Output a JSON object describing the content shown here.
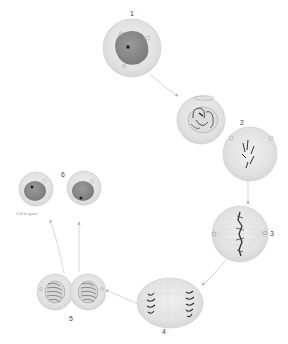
{
  "diagram": {
    "colors": {
      "cell_fill": "#e4e4e4",
      "cell_edge": "#cfcfcf",
      "inner_fill": "#f3f3f3",
      "nucleus_fill": "#8a8a8a",
      "chromosome": "#3c3c3c",
      "arrow": "#bdbdbd",
      "label": "#444444"
    },
    "stages": [
      {
        "id": "1",
        "label": "1",
        "name": "Interphase"
      },
      {
        "id": "2",
        "label": "2",
        "name": "Prophase"
      },
      {
        "id": "2b",
        "label": "",
        "name": "Prometaphase"
      },
      {
        "id": "3",
        "label": "3",
        "name": "Metaphase"
      },
      {
        "id": "4",
        "label": "4",
        "name": "Anaphase"
      },
      {
        "id": "5",
        "label": "5",
        "name": "Telophase / Cytokinesis"
      },
      {
        "id": "6",
        "label": "6",
        "name": "Daughter cells"
      }
    ],
    "caption_small": "Cell to grow"
  }
}
